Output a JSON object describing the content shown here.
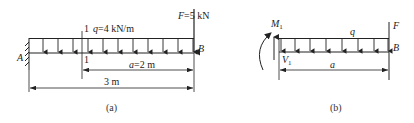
{
  "figure_a": {
    "caption": "(a)",
    "support_label": "A",
    "end_label": "B",
    "section_mark_top": "1",
    "section_mark_bottom": "1",
    "load_label": "q=4 kN/m",
    "force_label": "F=5 kN",
    "dim_segment_label": "a=2 m",
    "dim_total_label": "3 m"
  },
  "figure_b": {
    "caption": "(b)",
    "moment_label": "M",
    "moment_sub": "1",
    "shear_label": "V",
    "shear_sub": "1",
    "load_label": "q",
    "force_label": "F",
    "end_label": "B",
    "dim_label": "a"
  },
  "colors": {
    "line": "#222222",
    "background": "#ffffff"
  }
}
